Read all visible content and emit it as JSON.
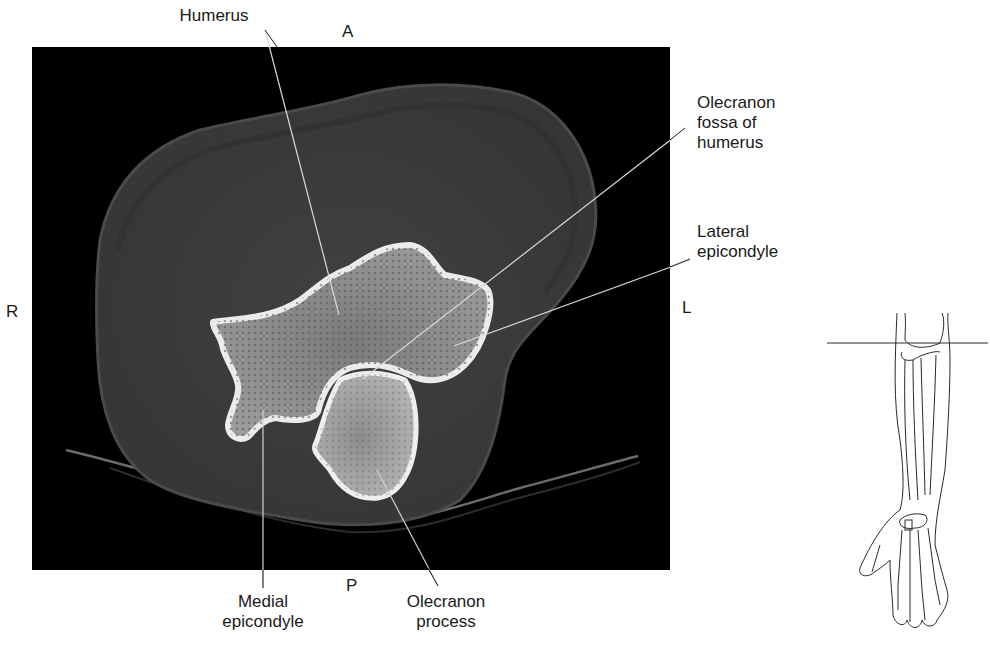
{
  "figure": {
    "type": "axial CT of elbow with locator sketch",
    "orientation": {
      "anterior": "A",
      "posterior": "P",
      "right": "R",
      "left": "L"
    },
    "labels": [
      {
        "id": "humerus",
        "lines": [
          "Humerus"
        ]
      },
      {
        "id": "olecranon-fossa",
        "lines": [
          "Olecranon",
          "fossa of",
          "humerus"
        ]
      },
      {
        "id": "lateral-epicondyle",
        "lines": [
          "Lateral",
          "epicondyle"
        ]
      },
      {
        "id": "medial-epicondyle",
        "lines": [
          "Medial",
          "epicondyle"
        ]
      },
      {
        "id": "olecranon-process",
        "lines": [
          "Olecranon",
          "process"
        ]
      }
    ],
    "colors": {
      "background": "#ffffff",
      "ct_background": "#000000",
      "soft_tissue": "#3c3c3c",
      "bone_cortex": "#e8e8e8",
      "bone_marrow": "#8a8a8a",
      "leader_line": "#d9d9d9",
      "text": "#1a1a1a"
    }
  }
}
